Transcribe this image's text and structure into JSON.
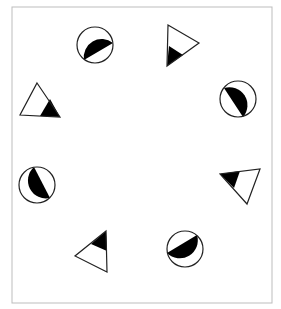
{
  "figure": {
    "frame": {
      "x": 12,
      "y": 7,
      "width": 260,
      "height": 296,
      "stroke": "#bdbdbd"
    },
    "colors": {
      "stroke": "#222222",
      "fill_dark": "#000000",
      "fill_light": "#ffffff"
    },
    "circles": [
      {
        "id": "circle-top-left",
        "cx": 95,
        "cy": 45,
        "r": 18,
        "dark_chord": [
          [
            113,
            43
          ],
          [
            84,
            60
          ]
        ],
        "dark_side": "lower-right"
      },
      {
        "id": "circle-right",
        "cx": 238,
        "cy": 99,
        "r": 18,
        "dark_chord": [
          [
            224,
            88
          ],
          [
            243,
            117
          ]
        ],
        "dark_side": "lower-left"
      },
      {
        "id": "circle-left",
        "cx": 37,
        "cy": 185,
        "r": 18,
        "dark_chord": [
          [
            34,
            167
          ],
          [
            50,
            198
          ]
        ],
        "dark_side": "right"
      },
      {
        "id": "circle-bottom-right",
        "cx": 185,
        "cy": 249,
        "r": 18,
        "dark_chord": [
          [
            167,
            253
          ],
          [
            197,
            235
          ]
        ],
        "dark_side": "upper-left"
      }
    ],
    "triangles": [
      {
        "id": "triangle-top-right",
        "points": [
          [
            168,
            25
          ],
          [
            199,
            43
          ],
          [
            167,
            66
          ]
        ],
        "dark_points": [
          [
            169,
            46
          ],
          [
            183,
            55
          ],
          [
            167,
            66
          ]
        ]
      },
      {
        "id": "triangle-left",
        "points": [
          [
            37,
            83
          ],
          [
            60,
            117
          ],
          [
            20,
            115
          ]
        ],
        "dark_points": [
          [
            50,
            99
          ],
          [
            60,
            117
          ],
          [
            40,
            116
          ]
        ]
      },
      {
        "id": "triangle-right",
        "points": [
          [
            260,
            169
          ],
          [
            247,
            204
          ],
          [
            220,
            174
          ]
        ],
        "dark_points": [
          [
            220,
            174
          ],
          [
            240,
            171
          ],
          [
            234,
            188
          ]
        ]
      },
      {
        "id": "triangle-bottom-left",
        "points": [
          [
            106,
            231
          ],
          [
            107,
            272
          ],
          [
            75,
            256
          ]
        ],
        "dark_points": [
          [
            106,
            231
          ],
          [
            107,
            251
          ],
          [
            91,
            244
          ]
        ]
      }
    ]
  }
}
